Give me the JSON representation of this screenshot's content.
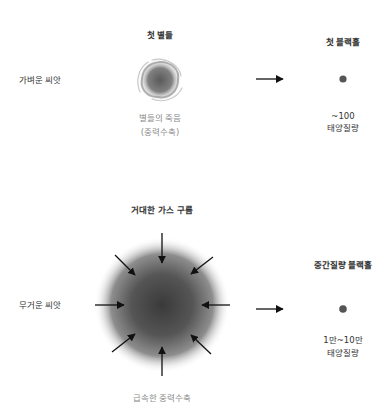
{
  "diagram": {
    "rows": [
      {
        "seed_label": "가벼운 씨앗",
        "source_title": "첫 별들",
        "process_label_line1": "별들의 죽음",
        "process_label_line2": "(중력수축)",
        "result_title": "첫 블랙홀",
        "mass_line1": "~100",
        "mass_line2": "태양질량"
      },
      {
        "seed_label": "무거운 씨앗",
        "source_title": "거대한 가스 구름",
        "process_label_line1": "급속한 중력수축",
        "result_title": "중간질량 블랙홀",
        "mass_line1": "1만~10만",
        "mass_line2": "태양질량"
      }
    ],
    "colors": {
      "background": "#ffffff",
      "cloud_center": "#3a3a3a",
      "black_hole_dot": "#555555",
      "arrow": "#111111",
      "secondary_text": "#8a8a8a"
    }
  }
}
